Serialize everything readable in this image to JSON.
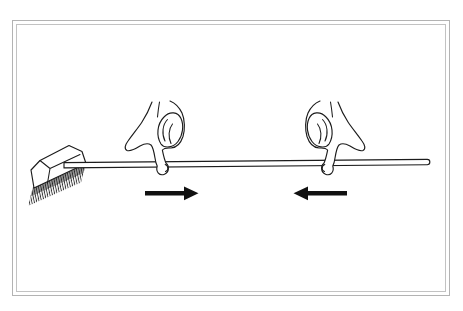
{
  "illustration": {
    "alt": "Line drawing of a horizontal broom with its brush head at the left; two hands rest the long handle on outstretched index fingers, and two solid black arrows beneath the handle point toward each other.",
    "objects": [
      {
        "name": "broom-head"
      },
      {
        "name": "broom-bristles"
      },
      {
        "name": "broom-handle"
      },
      {
        "name": "hand-left"
      },
      {
        "name": "hand-right"
      },
      {
        "name": "arrow-under-left-hand",
        "direction": "right"
      },
      {
        "name": "arrow-under-right-hand",
        "direction": "left"
      }
    ]
  },
  "colors": {
    "background": "#ffffff",
    "frame_outer_border": "#b3b3b3",
    "frame_inner_border": "#c2c2c2",
    "line_art": "#1c1c1c",
    "object_fill": "#ffffff",
    "arrow_black": "#111111",
    "bristle_shadow": "#3a3a3a"
  }
}
